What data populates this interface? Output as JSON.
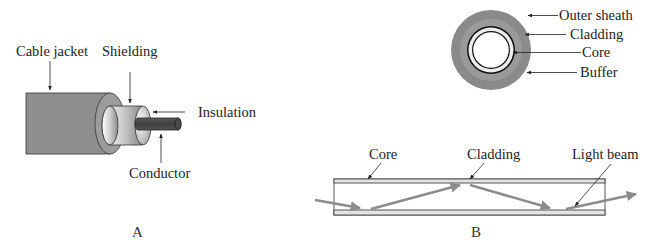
{
  "figure_a": {
    "caption": "A",
    "labels": {
      "cable_jacket": "Cable jacket",
      "shielding": "Shielding",
      "insulation": "Insulation",
      "conductor": "Conductor"
    }
  },
  "figure_b": {
    "caption": "B",
    "cross_section_labels": {
      "outer_sheath": "Outer sheath",
      "cladding": "Cladding",
      "core": "Core",
      "buffer": "Buffer"
    },
    "longitudinal_labels": {
      "core": "Core",
      "cladding": "Cladding",
      "light_beam": "Light beam"
    }
  },
  "colors": {
    "jacket_gray": "#8e8e8e",
    "conductor_dark": "#4a4a4a",
    "sheath_gray": "#8a8a8a",
    "beam_gray": "#8c8c8c",
    "line": "#333333"
  }
}
